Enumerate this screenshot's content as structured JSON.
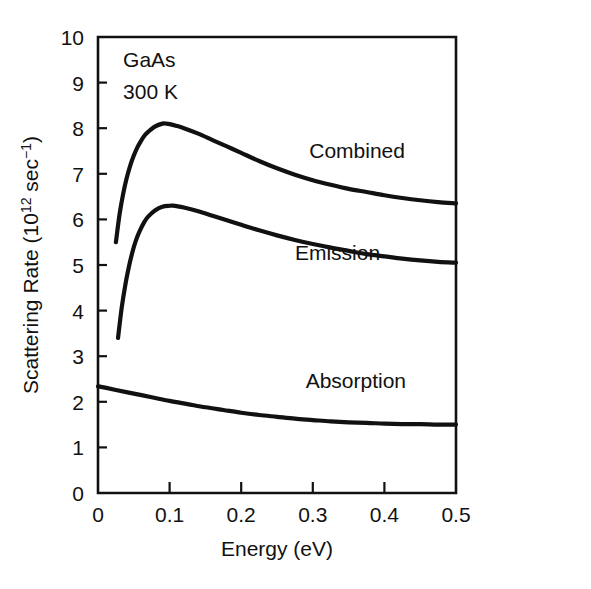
{
  "chart_data": {
    "type": "line",
    "title": "",
    "xlabel": "Energy (eV)",
    "ylabel": "Scattering Rate (10¹² sec⁻¹)",
    "ylabel_parts": {
      "main": "Scattering Rate (10",
      "exp1": "12",
      "mid": " sec",
      "exp2": "−1",
      "tail": ")"
    },
    "xlim": [
      0,
      0.5
    ],
    "ylim": [
      0,
      10
    ],
    "grid": false,
    "legend_position": "inline-curve-labels",
    "xticks": [
      0,
      0.1,
      0.2,
      0.3,
      0.4,
      0.5
    ],
    "xticklabels": [
      "0",
      "0.1",
      "0.2",
      "0.3",
      "0.4",
      "0.5"
    ],
    "yticks": [
      0,
      1,
      2,
      3,
      4,
      5,
      6,
      7,
      8,
      9,
      10
    ],
    "yticklabels": [
      "0",
      "1",
      "2",
      "3",
      "4",
      "5",
      "6",
      "7",
      "8",
      "9",
      "10"
    ],
    "annotations": [
      {
        "text": "GaAs",
        "x": 0.035,
        "y": 9.35
      },
      {
        "text": "300 K",
        "x": 0.035,
        "y": 8.65
      }
    ],
    "series": [
      {
        "name": "Combined",
        "label": "Combined",
        "label_x": 0.295,
        "label_y": 7.35,
        "x": [
          0.025,
          0.03,
          0.035,
          0.04,
          0.045,
          0.05,
          0.055,
          0.06,
          0.065,
          0.07,
          0.08,
          0.09,
          0.095,
          0.1,
          0.11,
          0.12,
          0.14,
          0.16,
          0.18,
          0.2,
          0.225,
          0.25,
          0.275,
          0.3,
          0.325,
          0.35,
          0.375,
          0.4,
          0.425,
          0.45,
          0.475,
          0.5
        ],
        "values": [
          5.5,
          6.1,
          6.55,
          6.9,
          7.18,
          7.4,
          7.58,
          7.72,
          7.84,
          7.92,
          8.04,
          8.1,
          8.1,
          8.09,
          8.05,
          8.0,
          7.88,
          7.74,
          7.6,
          7.46,
          7.28,
          7.12,
          6.98,
          6.86,
          6.76,
          6.67,
          6.6,
          6.53,
          6.47,
          6.42,
          6.38,
          6.35
        ]
      },
      {
        "name": "Emission",
        "label": "Emission",
        "label_x": 0.275,
        "label_y": 5.1,
        "x": [
          0.028,
          0.033,
          0.038,
          0.043,
          0.048,
          0.053,
          0.058,
          0.065,
          0.07,
          0.08,
          0.09,
          0.1,
          0.105,
          0.11,
          0.12,
          0.14,
          0.16,
          0.18,
          0.2,
          0.225,
          0.25,
          0.275,
          0.3,
          0.325,
          0.35,
          0.375,
          0.4,
          0.425,
          0.45,
          0.475,
          0.5
        ],
        "values": [
          3.4,
          4.05,
          4.55,
          4.95,
          5.28,
          5.54,
          5.74,
          5.95,
          6.06,
          6.2,
          6.28,
          6.3,
          6.3,
          6.29,
          6.26,
          6.18,
          6.08,
          5.98,
          5.88,
          5.76,
          5.65,
          5.55,
          5.46,
          5.38,
          5.31,
          5.24,
          5.19,
          5.14,
          5.1,
          5.07,
          5.05
        ]
      },
      {
        "name": "Absorption",
        "label": "Absorption",
        "label_x": 0.29,
        "label_y": 2.3,
        "x": [
          0.0,
          0.01,
          0.025,
          0.05,
          0.075,
          0.1,
          0.125,
          0.15,
          0.175,
          0.2,
          0.225,
          0.25,
          0.275,
          0.3,
          0.325,
          0.35,
          0.375,
          0.4,
          0.425,
          0.45,
          0.475,
          0.5
        ],
        "values": [
          2.34,
          2.31,
          2.26,
          2.18,
          2.1,
          2.02,
          1.95,
          1.88,
          1.82,
          1.76,
          1.71,
          1.67,
          1.63,
          1.6,
          1.57,
          1.55,
          1.54,
          1.52,
          1.51,
          1.51,
          1.5,
          1.5
        ]
      }
    ]
  }
}
